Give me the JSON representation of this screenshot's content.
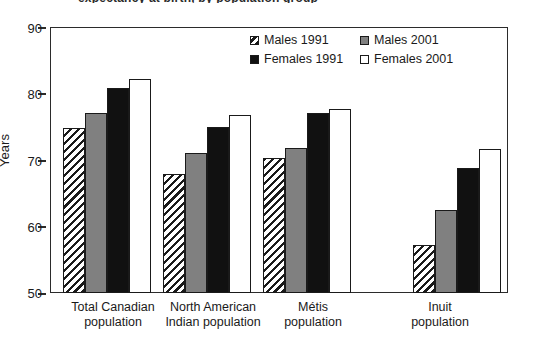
{
  "figure": {
    "title_remnant": "expectancy at birth, by population group",
    "background": "#ffffff"
  },
  "axis": {
    "y_title": "Years",
    "y_ticks": [
      "90",
      "80",
      "70",
      "60",
      "50"
    ],
    "y_min": 50,
    "y_max": 90
  },
  "legend": {
    "items": [
      {
        "label": "Males 1991",
        "swatch": "hatched-swatch"
      },
      {
        "label": "Males 2001",
        "swatch": "gray-swatch"
      },
      {
        "label": "Females 1991",
        "swatch": "black-swatch"
      },
      {
        "label": "Females 2001",
        "swatch": "white-swatch"
      }
    ]
  },
  "categories": [
    {
      "line1": "Total Canadian",
      "line2": "population"
    },
    {
      "line1": "North American",
      "line2": "Indian population"
    },
    {
      "line1": "Métis",
      "line2": "population"
    },
    {
      "line1": "Inuit",
      "line2": "population"
    }
  ],
  "colors": {
    "gray_series": "#808080",
    "black_series": "#111111",
    "white_series": "#ffffff",
    "outline": "#1a1a1a"
  },
  "chart_data": {
    "type": "bar",
    "xlabel": "",
    "ylabel": "Years",
    "ylim": [
      50,
      90
    ],
    "yticks": [
      50,
      60,
      70,
      80,
      90
    ],
    "grid": false,
    "legend_position": "top-right inside plot",
    "categories": [
      "Total Canadian population",
      "North American Indian population",
      "Métis population",
      "Inuit population"
    ],
    "series": [
      {
        "name": "Males 1991",
        "style": "hatched",
        "values": [
          74.8,
          67.9,
          70.3,
          57.2
        ]
      },
      {
        "name": "Males 2001",
        "style": "gray",
        "values": [
          77.1,
          71.1,
          71.8,
          62.5
        ]
      },
      {
        "name": "Females 1991",
        "style": "black",
        "values": [
          80.9,
          75.0,
          77.1,
          68.8
        ]
      },
      {
        "name": "Females 2001",
        "style": "white",
        "values": [
          82.2,
          76.7,
          77.7,
          71.6
        ]
      }
    ]
  }
}
